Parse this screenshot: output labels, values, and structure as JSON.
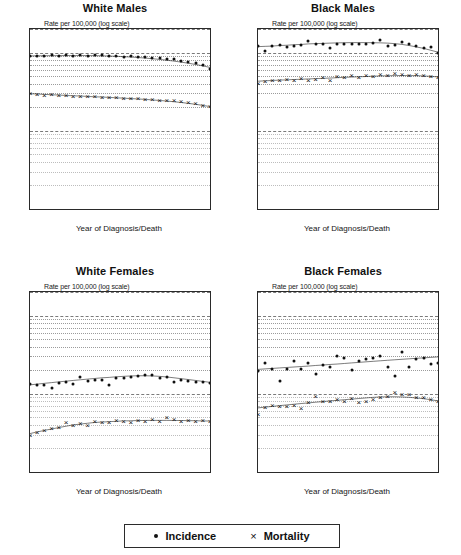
{
  "figure": {
    "xlabel": "Year of Diagnosis/Death",
    "ylabel_note": "Rate per 100,000 (log scale)",
    "yticks": [
      "20",
      "10",
      "1",
      "0.1"
    ],
    "xticks": [
      "1973",
      "1978",
      "1983",
      "1988",
      "1993",
      "1998"
    ],
    "legend": {
      "incidence_label": "Incidence",
      "mortality_label": "Mortality",
      "incidence_marker": "dot-marker",
      "mortality_marker": "x-marker"
    },
    "colors": {
      "ink": "#101010",
      "grid": "#7a7a7a",
      "frame": "#2a2a2a"
    }
  },
  "chart_data": [
    {
      "type": "scatter",
      "title": "White Males",
      "xlabel": "Year of Diagnosis/Death",
      "ylabel": "Rate per 100,000 (log scale)",
      "yscale": "log",
      "ylim": [
        0.1,
        20
      ],
      "xlim": [
        1973,
        1998
      ],
      "grid": true,
      "legend_position": "figure-bottom",
      "x": [
        1973,
        1974,
        1975,
        1976,
        1977,
        1978,
        1979,
        1980,
        1981,
        1982,
        1983,
        1984,
        1985,
        1986,
        1987,
        1988,
        1989,
        1990,
        1991,
        1992,
        1993,
        1994,
        1995,
        1996,
        1997,
        1998
      ],
      "series": [
        {
          "name": "Incidence",
          "marker": "dot",
          "values": [
            9.0,
            9.1,
            9.0,
            9.2,
            9.1,
            9.2,
            9.0,
            9.2,
            9.1,
            9.3,
            9.2,
            9.1,
            9.0,
            8.9,
            9.0,
            8.8,
            8.7,
            8.6,
            8.5,
            8.3,
            8.2,
            7.9,
            7.6,
            7.3,
            7.0,
            6.2
          ],
          "trend": [
            9.05,
            9.08,
            9.1,
            9.12,
            9.13,
            9.14,
            9.15,
            9.15,
            9.14,
            9.12,
            9.08,
            9.02,
            8.95,
            8.86,
            8.76,
            8.64,
            8.5,
            8.34,
            8.17,
            7.98,
            7.77,
            7.54,
            7.3,
            7.04,
            6.76,
            6.45
          ]
        },
        {
          "name": "Mortality",
          "marker": "x",
          "values": [
            3.0,
            2.95,
            2.9,
            2.92,
            2.88,
            2.85,
            2.8,
            2.82,
            2.78,
            2.75,
            2.7,
            2.72,
            2.68,
            2.65,
            2.6,
            2.62,
            2.58,
            2.55,
            2.5,
            2.48,
            2.45,
            2.4,
            2.35,
            2.25,
            2.15,
            2.05
          ],
          "trend": [
            2.98,
            2.95,
            2.92,
            2.89,
            2.86,
            2.83,
            2.8,
            2.78,
            2.75,
            2.72,
            2.7,
            2.67,
            2.64,
            2.61,
            2.58,
            2.55,
            2.52,
            2.48,
            2.44,
            2.4,
            2.35,
            2.3,
            2.24,
            2.18,
            2.11,
            2.04
          ]
        }
      ]
    },
    {
      "type": "scatter",
      "title": "Black Males",
      "xlabel": "Year of Diagnosis/Death",
      "ylabel": "Rate per 100,000 (log scale)",
      "yscale": "log",
      "ylim": [
        0.1,
        20
      ],
      "xlim": [
        1973,
        1998
      ],
      "grid": true,
      "legend_position": "figure-bottom",
      "x": [
        1973,
        1974,
        1975,
        1976,
        1977,
        1978,
        1979,
        1980,
        1981,
        1982,
        1983,
        1984,
        1985,
        1986,
        1987,
        1988,
        1989,
        1990,
        1991,
        1992,
        1993,
        1994,
        1995,
        1996,
        1997,
        1998
      ],
      "series": [
        {
          "name": "Incidence",
          "marker": "dot",
          "values": [
            12.0,
            10.6,
            12.0,
            12.5,
            11.8,
            12.2,
            12.6,
            14.0,
            12.8,
            13.0,
            11.6,
            12.8,
            12.7,
            12.9,
            12.9,
            13.0,
            13.2,
            14.4,
            12.0,
            12.6,
            13.5,
            13.0,
            12.2,
            11.5,
            11.9,
            10.0
          ],
          "trend": [
            11.9,
            12.0,
            12.1,
            12.3,
            12.4,
            12.6,
            12.7,
            12.9,
            13.0,
            13.1,
            13.2,
            13.3,
            13.35,
            13.4,
            13.4,
            13.4,
            13.35,
            13.3,
            13.2,
            13.0,
            12.7,
            12.3,
            11.8,
            11.3,
            10.7,
            10.1
          ]
        },
        {
          "name": "Mortality",
          "marker": "x",
          "values": [
            4.1,
            4.3,
            4.5,
            4.4,
            4.6,
            4.5,
            4.7,
            4.4,
            4.6,
            4.8,
            4.5,
            5.0,
            4.9,
            5.1,
            4.9,
            5.2,
            5.0,
            5.3,
            5.1,
            5.4,
            5.3,
            5.2,
            5.3,
            5.1,
            5.0,
            4.8
          ],
          "trend": [
            4.3,
            4.35,
            4.4,
            4.44,
            4.48,
            4.52,
            4.56,
            4.6,
            4.64,
            4.68,
            4.72,
            4.77,
            4.82,
            4.86,
            4.9,
            4.94,
            4.98,
            5.02,
            5.05,
            5.07,
            5.08,
            5.08,
            5.06,
            5.02,
            4.96,
            4.88
          ]
        }
      ]
    },
    {
      "type": "scatter",
      "title": "White Females",
      "xlabel": "Year of Diagnosis/Death",
      "ylabel": "Rate per 100,000 (log scale)",
      "yscale": "log",
      "ylim": [
        0.1,
        20
      ],
      "xlim": [
        1973,
        1998
      ],
      "grid": true,
      "legend_position": "figure-bottom",
      "x": [
        1973,
        1974,
        1975,
        1976,
        1977,
        1978,
        1979,
        1980,
        1981,
        1982,
        1983,
        1984,
        1985,
        1986,
        1987,
        1988,
        1989,
        1990,
        1991,
        1992,
        1993,
        1994,
        1995,
        1996,
        1997,
        1998
      ],
      "series": [
        {
          "name": "Incidence",
          "marker": "dot",
          "values": [
            1.32,
            1.3,
            1.28,
            1.2,
            1.38,
            1.42,
            1.35,
            1.62,
            1.45,
            1.5,
            1.52,
            1.28,
            1.6,
            1.58,
            1.62,
            1.7,
            1.72,
            1.75,
            1.6,
            1.65,
            1.42,
            1.5,
            1.45,
            1.42,
            1.4,
            1.38
          ],
          "trend": [
            1.3,
            1.33,
            1.36,
            1.39,
            1.42,
            1.45,
            1.48,
            1.51,
            1.54,
            1.57,
            1.6,
            1.62,
            1.65,
            1.67,
            1.69,
            1.7,
            1.7,
            1.69,
            1.67,
            1.64,
            1.6,
            1.56,
            1.52,
            1.48,
            1.44,
            1.4
          ]
        },
        {
          "name": "Mortality",
          "marker": "x",
          "values": [
            0.3,
            0.32,
            0.34,
            0.36,
            0.38,
            0.44,
            0.4,
            0.42,
            0.4,
            0.45,
            0.43,
            0.44,
            0.46,
            0.45,
            0.44,
            0.46,
            0.45,
            0.47,
            0.45,
            0.5,
            0.48,
            0.45,
            0.46,
            0.45,
            0.46,
            0.45
          ],
          "trend": [
            0.31,
            0.325,
            0.34,
            0.355,
            0.37,
            0.385,
            0.4,
            0.41,
            0.42,
            0.43,
            0.435,
            0.44,
            0.445,
            0.45,
            0.452,
            0.455,
            0.456,
            0.457,
            0.457,
            0.457,
            0.456,
            0.455,
            0.454,
            0.452,
            0.45,
            0.448
          ]
        }
      ]
    },
    {
      "type": "scatter",
      "title": "Black Females",
      "xlabel": "Year of Diagnosis/Death",
      "ylabel": "Rate per 100,000 (log scale)",
      "yscale": "log",
      "ylim": [
        0.1,
        20
      ],
      "xlim": [
        1973,
        1998
      ],
      "grid": true,
      "legend_position": "figure-bottom",
      "x": [
        1973,
        1974,
        1975,
        1976,
        1977,
        1978,
        1979,
        1980,
        1981,
        1982,
        1983,
        1984,
        1985,
        1986,
        1987,
        1988,
        1989,
        1990,
        1991,
        1992,
        1993,
        1994,
        1995,
        1996,
        1997,
        1998
      ],
      "series": [
        {
          "name": "Incidence",
          "marker": "dot",
          "values": [
            1.95,
            2.5,
            2.1,
            1.45,
            2.1,
            2.6,
            2.1,
            2.5,
            1.8,
            2.3,
            2.2,
            3.0,
            2.9,
            2.0,
            2.6,
            2.8,
            2.9,
            3.0,
            2.2,
            1.7,
            3.4,
            2.2,
            2.8,
            2.9,
            2.4,
            2.5
          ],
          "trend": [
            2.05,
            2.08,
            2.11,
            2.14,
            2.17,
            2.2,
            2.23,
            2.26,
            2.3,
            2.33,
            2.37,
            2.4,
            2.44,
            2.48,
            2.52,
            2.56,
            2.6,
            2.64,
            2.68,
            2.72,
            2.76,
            2.8,
            2.84,
            2.88,
            2.92,
            2.96
          ]
        },
        {
          "name": "Mortality",
          "marker": "x",
          "values": [
            0.55,
            0.68,
            0.72,
            0.7,
            0.69,
            0.72,
            0.65,
            0.78,
            0.95,
            0.8,
            0.82,
            0.85,
            0.8,
            0.88,
            0.78,
            0.82,
            0.86,
            0.9,
            0.95,
            1.05,
            0.98,
            1.0,
            0.92,
            0.9,
            0.85,
            0.8
          ],
          "trend": [
            0.66,
            0.675,
            0.69,
            0.705,
            0.72,
            0.735,
            0.75,
            0.765,
            0.78,
            0.795,
            0.81,
            0.825,
            0.84,
            0.855,
            0.87,
            0.885,
            0.9,
            0.91,
            0.915,
            0.915,
            0.91,
            0.9,
            0.885,
            0.865,
            0.84,
            0.81
          ]
        }
      ]
    }
  ]
}
